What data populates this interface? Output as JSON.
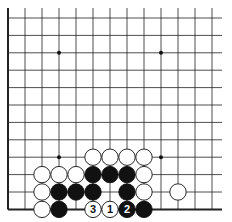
{
  "diagram": {
    "type": "go-board",
    "grid": {
      "x0": 8,
      "y0": 18,
      "dx": 17,
      "dy": 17.4,
      "cols": 13,
      "rows": 12,
      "left_edge": true,
      "bottom_edge": true
    },
    "star_points": [
      [
        3,
        2
      ],
      [
        9,
        2
      ],
      [
        3,
        8
      ],
      [
        9,
        8
      ]
    ],
    "stones": [
      {
        "c": 5,
        "r": 8,
        "color": "white"
      },
      {
        "c": 6,
        "r": 8,
        "color": "white"
      },
      {
        "c": 7,
        "r": 8,
        "color": "white"
      },
      {
        "c": 8,
        "r": 8,
        "color": "white"
      },
      {
        "c": 2,
        "r": 9,
        "color": "white"
      },
      {
        "c": 3,
        "r": 9,
        "color": "white"
      },
      {
        "c": 4,
        "r": 9,
        "color": "white"
      },
      {
        "c": 5,
        "r": 9,
        "color": "black"
      },
      {
        "c": 6,
        "r": 9,
        "color": "black"
      },
      {
        "c": 7,
        "r": 9,
        "color": "black"
      },
      {
        "c": 8,
        "r": 9,
        "color": "white"
      },
      {
        "c": 2,
        "r": 10,
        "color": "white"
      },
      {
        "c": 3,
        "r": 10,
        "color": "black"
      },
      {
        "c": 4,
        "r": 10,
        "color": "black"
      },
      {
        "c": 5,
        "r": 10,
        "color": "black"
      },
      {
        "c": 7,
        "r": 10,
        "color": "black"
      },
      {
        "c": 8,
        "r": 10,
        "color": "white"
      },
      {
        "c": 10,
        "r": 10,
        "color": "white"
      },
      {
        "c": 2,
        "r": 11,
        "color": "white"
      },
      {
        "c": 3,
        "r": 11,
        "color": "black"
      },
      {
        "c": 5,
        "r": 11,
        "color": "white",
        "label": "3"
      },
      {
        "c": 6,
        "r": 11,
        "color": "white",
        "label": "1"
      },
      {
        "c": 7,
        "r": 11,
        "color": "black",
        "label": "2"
      },
      {
        "c": 8,
        "r": 11,
        "color": "black"
      }
    ]
  }
}
